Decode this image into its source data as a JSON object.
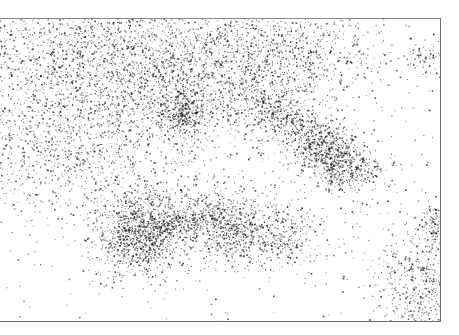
{
  "chart_data": {
    "type": "scatter",
    "title": "",
    "xlabel": "",
    "ylabel": "",
    "grid": false,
    "legend": null,
    "axes": {
      "ticks": false,
      "spines": [
        "top",
        "right",
        "bottom"
      ]
    },
    "point_color": "#2a2a2a",
    "background": "#ffffff",
    "frame": {
      "left": 0,
      "top": 18,
      "right": 441,
      "bottom": 322
    },
    "clusters": [
      {
        "name": "upper-left-band",
        "cx": 110,
        "cy": 70,
        "sx": 95,
        "sy": 45,
        "n": 2600,
        "rot": 0.25
      },
      {
        "name": "upper-center-band",
        "cx": 215,
        "cy": 55,
        "sx": 70,
        "sy": 30,
        "n": 1200,
        "rot": 0.1
      },
      {
        "name": "upper-right-sparse",
        "cx": 300,
        "cy": 45,
        "sx": 45,
        "sy": 22,
        "n": 400,
        "rot": 0.0
      },
      {
        "name": "center-star",
        "cx": 185,
        "cy": 112,
        "sx": 12,
        "sy": 10,
        "n": 350,
        "rot": 0.0
      },
      {
        "name": "right-diagonal",
        "cx": 300,
        "cy": 125,
        "sx": 40,
        "sy": 14,
        "n": 700,
        "rot": 0.55
      },
      {
        "name": "right-blob",
        "cx": 338,
        "cy": 160,
        "sx": 22,
        "sy": 14,
        "n": 650,
        "rot": 0.4
      },
      {
        "name": "lower-left-core",
        "cx": 140,
        "cy": 232,
        "sx": 22,
        "sy": 22,
        "n": 1100,
        "rot": 0.0
      },
      {
        "name": "lower-center-blob",
        "cx": 240,
        "cy": 228,
        "sx": 42,
        "sy": 18,
        "n": 1200,
        "rot": 0.15
      },
      {
        "name": "lower-bridge",
        "cx": 185,
        "cy": 220,
        "sx": 28,
        "sy": 5,
        "n": 250,
        "rot": -0.25
      },
      {
        "name": "left-mid-spread",
        "cx": 60,
        "cy": 150,
        "sx": 55,
        "sy": 40,
        "n": 900,
        "rot": 0.0
      },
      {
        "name": "lower-right-corner",
        "cx": 430,
        "cy": 290,
        "sx": 30,
        "sy": 40,
        "n": 900,
        "rot": 0.3
      },
      {
        "name": "far-right-mid",
        "cx": 438,
        "cy": 225,
        "sx": 8,
        "sy": 12,
        "n": 120,
        "rot": 0.0
      },
      {
        "name": "upper-right-edge",
        "cx": 432,
        "cy": 58,
        "sx": 14,
        "sy": 8,
        "n": 80,
        "rot": 0.0
      },
      {
        "name": "background-noise",
        "cx": 230,
        "cy": 170,
        "sx": 200,
        "sy": 140,
        "n": 700,
        "rot": 0.0
      }
    ],
    "seed": 42
  }
}
